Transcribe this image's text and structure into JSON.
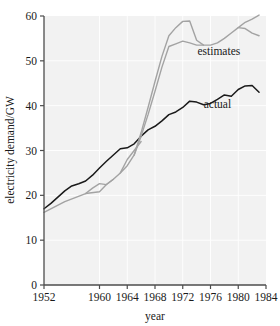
{
  "chart_data": {
    "type": "line",
    "title": "",
    "xlabel": "year",
    "ylabel": "electricity demand/GW",
    "xlim": [
      1952,
      1984
    ],
    "ylim": [
      0,
      60
    ],
    "grid": true,
    "legend_position": "inline-annotations",
    "xticks": [
      1952,
      1960,
      1964,
      1968,
      1972,
      1976,
      1980,
      1984
    ],
    "xtick_labels": [
      "1952",
      "1960",
      "1964",
      "1968",
      "1972",
      "1976",
      "1980",
      "1984"
    ],
    "yticks": [
      0,
      10,
      20,
      30,
      40,
      50,
      60
    ],
    "ytick_labels": [
      "0",
      "10",
      "20",
      "30",
      "40",
      "50",
      "60"
    ],
    "annotations": [
      {
        "text": "estimates",
        "x": 1977.2,
        "y": 51.4,
        "color": "#1a1a1a"
      },
      {
        "text": "actual",
        "x": 1977.0,
        "y": 39.4,
        "color": "#1a1a1a"
      }
    ],
    "series": [
      {
        "name": "actual",
        "color": "#1a1a1a",
        "width": 1.5,
        "points": [
          [
            1952,
            17.0
          ],
          [
            1953,
            18.2
          ],
          [
            1954,
            19.6
          ],
          [
            1955,
            21.0
          ],
          [
            1956,
            22.1
          ],
          [
            1957,
            22.6
          ],
          [
            1958,
            23.2
          ],
          [
            1959,
            24.5
          ],
          [
            1960,
            26.1
          ],
          [
            1961,
            27.6
          ],
          [
            1962,
            29.0
          ],
          [
            1963,
            30.4
          ],
          [
            1964,
            30.6
          ],
          [
            1965,
            31.5
          ],
          [
            1966,
            33.2
          ],
          [
            1967,
            34.6
          ],
          [
            1968,
            35.4
          ],
          [
            1969,
            36.6
          ],
          [
            1970,
            38.0
          ],
          [
            1971,
            38.6
          ],
          [
            1972,
            39.6
          ],
          [
            1973,
            41.0
          ],
          [
            1974,
            40.8
          ],
          [
            1975,
            40.2
          ],
          [
            1976,
            40.5
          ],
          [
            1977,
            41.4
          ],
          [
            1978,
            42.4
          ],
          [
            1979,
            42.1
          ],
          [
            1980,
            43.6
          ],
          [
            1981,
            44.4
          ],
          [
            1982,
            44.5
          ],
          [
            1983,
            43.0
          ]
        ]
      },
      {
        "name": "estimates-main",
        "color": "#a3a3a3",
        "width": 1.4,
        "points": [
          [
            1952,
            16.2
          ],
          [
            1955,
            18.6
          ],
          [
            1958,
            20.4
          ],
          [
            1960,
            20.8
          ],
          [
            1961,
            22.4
          ],
          [
            1962,
            23.6
          ],
          [
            1963,
            25.0
          ],
          [
            1964,
            26.6
          ],
          [
            1965,
            29.0
          ],
          [
            1966,
            33.2
          ],
          [
            1967,
            38.0
          ],
          [
            1968,
            43.2
          ],
          [
            1969,
            48.6
          ],
          [
            1970,
            53.2
          ],
          [
            1971,
            53.8
          ],
          [
            1972,
            54.4
          ],
          [
            1973,
            54.0
          ],
          [
            1974,
            53.5
          ],
          [
            1975,
            53.5
          ],
          [
            1976,
            53.5
          ],
          [
            1977,
            54.0
          ],
          [
            1978,
            55.0
          ],
          [
            1979,
            56.2
          ],
          [
            1980,
            57.4
          ],
          [
            1981,
            58.6
          ],
          [
            1982,
            59.3
          ],
          [
            1983,
            60.2
          ]
        ]
      },
      {
        "name": "estimates-upper",
        "color": "#a3a3a3",
        "width": 1.4,
        "points": [
          [
            1965,
            29.0
          ],
          [
            1966,
            34.0
          ],
          [
            1967,
            39.6
          ],
          [
            1968,
            45.4
          ],
          [
            1969,
            51.0
          ],
          [
            1970,
            55.6
          ],
          [
            1971,
            57.4
          ],
          [
            1972,
            58.8
          ],
          [
            1973,
            58.9
          ],
          [
            1974,
            54.6
          ],
          [
            1975,
            53.5
          ]
        ]
      },
      {
        "name": "estimates-tail-lower",
        "color": "#a3a3a3",
        "width": 1.4,
        "points": [
          [
            1980,
            57.4
          ],
          [
            1981,
            57.2
          ],
          [
            1982,
            56.2
          ],
          [
            1983,
            55.6
          ]
        ]
      },
      {
        "name": "estimates-early-branch",
        "color": "#a3a3a3",
        "width": 1.4,
        "points": [
          [
            1958,
            20.4
          ],
          [
            1959,
            21.6
          ],
          [
            1960,
            22.6
          ],
          [
            1961,
            22.4
          ],
          [
            1962,
            23.6
          ]
        ]
      },
      {
        "name": "estimates-mid-branch",
        "color": "#a3a3a3",
        "width": 1.4,
        "points": [
          [
            1963,
            25.0
          ],
          [
            1964,
            28.0
          ],
          [
            1965,
            30.0
          ],
          [
            1966,
            32.0
          ]
        ]
      }
    ]
  },
  "axes": {
    "x_axis_name": "year-axis",
    "y_axis_name": "electricity-demand-axis"
  }
}
